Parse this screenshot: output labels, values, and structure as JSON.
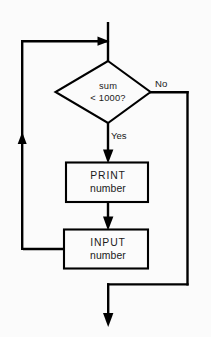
{
  "diagram": {
    "type": "flowchart",
    "colors": {
      "background": "#fbfbfb",
      "line": "#000000",
      "shape_fill": "#fbfbfb",
      "text": "#1a1a1a"
    },
    "nodes": [
      {
        "id": "decision-sum",
        "shape": "diamond",
        "name": "decision-sum-less-than-1000",
        "text_line1": "sum",
        "text_line2": "< 1000?"
      },
      {
        "id": "process-print",
        "shape": "rectangle",
        "name": "process-print-number",
        "text_line1": "PRINT",
        "text_line2": "number"
      },
      {
        "id": "process-input",
        "shape": "rectangle",
        "name": "process-input-number",
        "text_line1": "INPUT",
        "text_line2": "number"
      }
    ],
    "edge_labels": {
      "no": "No",
      "yes": "Yes"
    }
  }
}
